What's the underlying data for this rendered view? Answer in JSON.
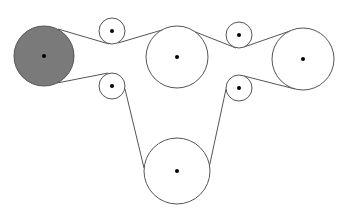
{
  "diagram": {
    "title": "",
    "stroke_color": "#555555",
    "fill_driver": "#7a7a7a",
    "fill_pulley": "#ffffff",
    "center_dot_color": "#000000",
    "pulleys": [
      {
        "id": "driver",
        "cx": 44,
        "cy": 56,
        "r": 30,
        "filled": true
      },
      {
        "id": "idler-top-left",
        "cx": 112,
        "cy": 31,
        "r": 13,
        "filled": false
      },
      {
        "id": "pulley-top-middle",
        "cx": 177,
        "cy": 57,
        "r": 31,
        "filled": false
      },
      {
        "id": "idler-top-right",
        "cx": 239,
        "cy": 35,
        "r": 13,
        "filled": false
      },
      {
        "id": "pulley-right",
        "cx": 303,
        "cy": 59,
        "r": 31,
        "filled": false
      },
      {
        "id": "idler-lower-left",
        "cx": 112,
        "cy": 86,
        "r": 13,
        "filled": false
      },
      {
        "id": "idler-lower-right",
        "cx": 239,
        "cy": 88,
        "r": 13,
        "filled": false
      },
      {
        "id": "pulley-bottom",
        "cx": 177,
        "cy": 171,
        "r": 33,
        "filled": false
      }
    ],
    "belt_segments": [
      {
        "x1": 58,
        "y1": 29,
        "x2": 109,
        "y2": 44
      },
      {
        "x1": 118,
        "y1": 43,
        "x2": 162,
        "y2": 30
      },
      {
        "x1": 193,
        "y1": 31,
        "x2": 236,
        "y2": 48
      },
      {
        "x1": 244,
        "y1": 47,
        "x2": 290,
        "y2": 31
      },
      {
        "x1": 295,
        "y1": 89,
        "x2": 244,
        "y2": 76
      },
      {
        "x1": 226,
        "y1": 89,
        "x2": 209,
        "y2": 168
      },
      {
        "x1": 144,
        "y1": 168,
        "x2": 125,
        "y2": 89
      },
      {
        "x1": 108,
        "y1": 73,
        "x2": 57,
        "y2": 83
      }
    ]
  }
}
